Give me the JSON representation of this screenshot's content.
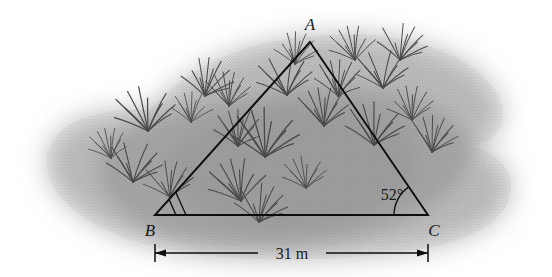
{
  "figure": {
    "type": "geometry-diagram"
  },
  "triangle": {
    "vertices": [
      {
        "id": "A",
        "label": "A",
        "x": 310,
        "y": 42,
        "label_x": 310,
        "label_y": 30
      },
      {
        "id": "B",
        "label": "B",
        "x": 155,
        "y": 215,
        "label_x": 150,
        "label_y": 236
      },
      {
        "id": "C",
        "label": "C",
        "x": 428,
        "y": 215,
        "label_x": 434,
        "label_y": 236
      }
    ]
  },
  "angles": [
    {
      "at": "C",
      "label": "52°",
      "value": 52,
      "unit": "degrees",
      "label_x": 392,
      "label_y": 200,
      "has_arc": true
    },
    {
      "at": "B",
      "label": "",
      "has_arc": false,
      "has_double_mark": true
    }
  ],
  "dimension": {
    "label": "31 m",
    "value": 31,
    "unit": "m",
    "from": "B",
    "to": "C",
    "x1": 155,
    "x2": 428,
    "y": 253,
    "label_x": 292,
    "label_y": 259
  },
  "field": {
    "fill_outer": "#bdbdbd",
    "fill_inner": "#a6a6a6",
    "fill_core": "#9e9e9e"
  },
  "colors": {
    "line": "#0d0d0d",
    "text": "#1a1a1a",
    "grass": "#4a4a4a",
    "background": "#ffffff"
  },
  "grass_tufts": [
    {
      "x": 148,
      "y": 131,
      "s": 1.05,
      "r": -8
    },
    {
      "x": 133,
      "y": 182,
      "s": 0.95,
      "r": 6
    },
    {
      "x": 170,
      "y": 197,
      "s": 0.85,
      "r": -4
    },
    {
      "x": 205,
      "y": 96,
      "s": 0.9,
      "r": 10
    },
    {
      "x": 229,
      "y": 106,
      "s": 0.8,
      "r": -6
    },
    {
      "x": 238,
      "y": 146,
      "s": 0.85,
      "r": 4
    },
    {
      "x": 241,
      "y": 201,
      "s": 1.0,
      "r": -10
    },
    {
      "x": 265,
      "y": 157,
      "s": 1.15,
      "r": 3
    },
    {
      "x": 287,
      "y": 95,
      "s": 0.95,
      "r": -7
    },
    {
      "x": 259,
      "y": 222,
      "s": 0.9,
      "r": 8
    },
    {
      "x": 295,
      "y": 64,
      "s": 0.75,
      "r": 5
    },
    {
      "x": 324,
      "y": 126,
      "s": 0.9,
      "r": -5
    },
    {
      "x": 338,
      "y": 96,
      "s": 0.85,
      "r": 7
    },
    {
      "x": 355,
      "y": 60,
      "s": 0.8,
      "r": -9
    },
    {
      "x": 374,
      "y": 145,
      "s": 1.0,
      "r": 4
    },
    {
      "x": 383,
      "y": 88,
      "s": 0.9,
      "r": -3
    },
    {
      "x": 400,
      "y": 60,
      "s": 0.85,
      "r": 9
    },
    {
      "x": 412,
      "y": 120,
      "s": 0.8,
      "r": -6
    },
    {
      "x": 432,
      "y": 152,
      "s": 0.85,
      "r": 5
    },
    {
      "x": 111,
      "y": 158,
      "s": 0.7,
      "r": -8
    },
    {
      "x": 191,
      "y": 122,
      "s": 0.7,
      "r": 6
    },
    {
      "x": 306,
      "y": 188,
      "s": 0.75,
      "r": -5
    }
  ]
}
